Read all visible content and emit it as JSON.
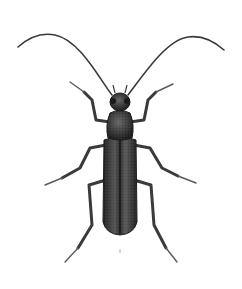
{
  "image": {
    "subject": "beetle illustration",
    "description": "Dorsal view of a long-horned beetle with long antennae and six legs, dark stippled body",
    "colors": {
      "background": "#ffffff",
      "body": "#2b2b2b",
      "body_highlight": "#6a6a6a",
      "legs": "#3a3a3a",
      "leg_light": "#8a8a8a"
    }
  }
}
